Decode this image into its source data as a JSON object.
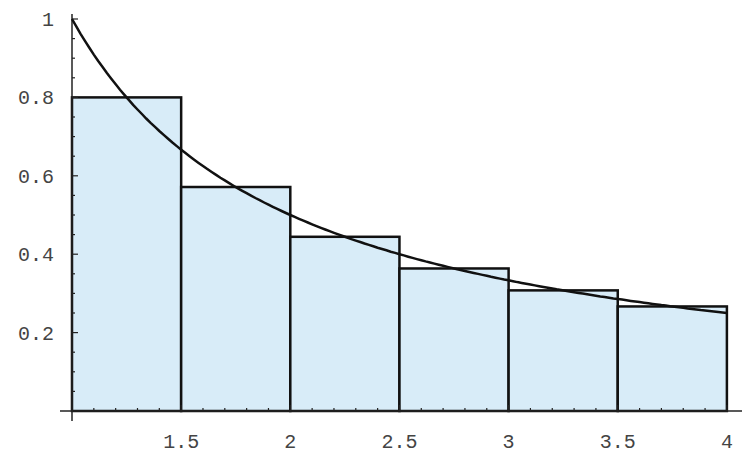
{
  "chart_data": {
    "type": "bar",
    "title": "",
    "xlabel": "",
    "ylabel": "",
    "xlim": [
      1,
      4
    ],
    "ylim": [
      0,
      1
    ],
    "grid": false,
    "legend": null,
    "x_ticks": [
      1.5,
      2,
      2.5,
      3,
      3.5,
      4
    ],
    "x_tick_labels": [
      "1.5",
      "2",
      "2.5",
      "3",
      "3.5",
      "4"
    ],
    "y_ticks": [
      0.2,
      0.4,
      0.6,
      0.8,
      1
    ],
    "y_tick_labels": [
      "0.2",
      "0.4",
      "0.6",
      "0.8",
      "1"
    ],
    "bars": [
      {
        "x0": 1.0,
        "x1": 1.5,
        "height": 0.8
      },
      {
        "x0": 1.5,
        "x1": 2.0,
        "height": 0.5714
      },
      {
        "x0": 2.0,
        "x1": 2.5,
        "height": 0.4444
      },
      {
        "x0": 2.5,
        "x1": 3.0,
        "height": 0.3636
      },
      {
        "x0": 3.0,
        "x1": 3.5,
        "height": 0.3077
      },
      {
        "x0": 3.5,
        "x1": 4.0,
        "height": 0.2667
      }
    ],
    "categories": [
      "1–1.5",
      "1.5–2",
      "2–2.5",
      "2.5–3",
      "3–3.5",
      "3.5–4"
    ],
    "values": [
      0.8,
      0.5714,
      0.4444,
      0.3636,
      0.3077,
      0.2667
    ],
    "curve": {
      "name": "y = 1/x",
      "x": [
        1.0,
        1.25,
        1.5,
        1.75,
        2.0,
        2.25,
        2.5,
        2.75,
        3.0,
        3.25,
        3.5,
        3.75,
        4.0
      ],
      "y": [
        1.0,
        0.8,
        0.6667,
        0.5714,
        0.5,
        0.4444,
        0.4,
        0.3636,
        0.3333,
        0.3077,
        0.2857,
        0.2667,
        0.25
      ]
    },
    "colors": {
      "bar_fill": "#d8ecf8",
      "bar_stroke": "#111111",
      "curve": "#111111",
      "axis": "#222222"
    }
  }
}
